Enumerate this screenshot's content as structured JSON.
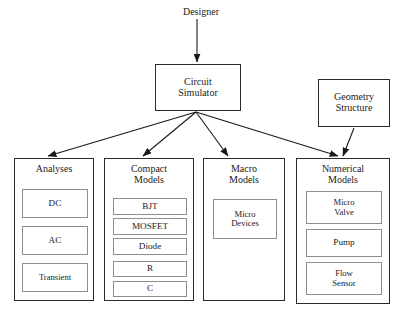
{
  "diagram": {
    "title_label": "Designer",
    "root_actor": {
      "name": "designer",
      "label": "Designer"
    },
    "nodes": [
      {
        "id": "circuit-simulator",
        "label": "Circuit\nSimulator",
        "x": 155,
        "y": 64,
        "w": 86,
        "h": 47
      },
      {
        "id": "geometry-structure",
        "label": "Geometry\nStructure",
        "x": 318,
        "y": 79,
        "w": 72,
        "h": 48
      }
    ],
    "columns": [
      {
        "id": "analyses",
        "title": "Analyses",
        "x": 14,
        "y": 158,
        "w": 80,
        "h": 143,
        "items": [
          {
            "id": "dc",
            "label": "DC",
            "x": 7,
            "y": 30,
            "w": 66,
            "h": 29
          },
          {
            "id": "ac",
            "label": "AC",
            "x": 7,
            "y": 67,
            "w": 66,
            "h": 29
          },
          {
            "id": "transient",
            "label": "Transient",
            "x": 7,
            "y": 104,
            "w": 66,
            "h": 29
          }
        ]
      },
      {
        "id": "compact-models",
        "title": "Compact\nModels",
        "x": 104,
        "y": 158,
        "w": 90,
        "h": 143,
        "items": [
          {
            "id": "bjt",
            "label": "BJT",
            "x": 8,
            "y": 39,
            "w": 74,
            "h": 17
          },
          {
            "id": "mosfet",
            "label": "MOSFET",
            "x": 8,
            "y": 59,
            "w": 74,
            "h": 17
          },
          {
            "id": "diode",
            "label": "Diode",
            "x": 8,
            "y": 79,
            "w": 74,
            "h": 17
          },
          {
            "id": "r",
            "label": "R",
            "x": 8,
            "y": 102,
            "w": 74,
            "h": 16
          },
          {
            "id": "c",
            "label": "C",
            "x": 8,
            "y": 122,
            "w": 74,
            "h": 16
          }
        ]
      },
      {
        "id": "macro-models",
        "title": "Macro\nModels",
        "x": 203,
        "y": 158,
        "w": 82,
        "h": 143,
        "items": [
          {
            "id": "micro-devices",
            "label": "Micro\nDevices",
            "x": 9,
            "y": 40,
            "w": 64,
            "h": 40
          }
        ]
      },
      {
        "id": "numerical-models",
        "title": "Numerical\nModels",
        "x": 296,
        "y": 158,
        "w": 94,
        "h": 146,
        "items": [
          {
            "id": "micro-valve",
            "label": "Micro\nValve",
            "x": 9,
            "y": 32,
            "w": 76,
            "h": 33
          },
          {
            "id": "pump",
            "label": "Pump",
            "x": 9,
            "y": 70,
            "w": 76,
            "h": 28
          },
          {
            "id": "flow-sensor",
            "label": "Flow\nSensor",
            "x": 9,
            "y": 103,
            "w": 76,
            "h": 33
          }
        ]
      }
    ],
    "edges": [
      {
        "id": "designer-to-simulator",
        "from": "designer",
        "to": "circuit-simulator",
        "x1": 197,
        "y1": 19,
        "x2": 197,
        "y2": 62
      },
      {
        "id": "simulator-to-analyses",
        "from": "circuit-simulator",
        "to": "analyses",
        "x1": 196,
        "y1": 112,
        "x2": 48,
        "y2": 156
      },
      {
        "id": "simulator-to-compact",
        "from": "circuit-simulator",
        "to": "compact-models",
        "x1": 196,
        "y1": 112,
        "x2": 143,
        "y2": 156
      },
      {
        "id": "simulator-to-macro",
        "from": "circuit-simulator",
        "to": "macro-models",
        "x1": 196,
        "y1": 112,
        "x2": 228,
        "y2": 156
      },
      {
        "id": "simulator-to-numerical",
        "from": "circuit-simulator",
        "to": "numerical-models",
        "x1": 196,
        "y1": 112,
        "x2": 338,
        "y2": 156
      },
      {
        "id": "geometry-to-numerical",
        "from": "geometry-structure",
        "to": "numerical-models",
        "x1": 354,
        "y1": 128,
        "x2": 343,
        "y2": 156
      }
    ],
    "style": {
      "background": "#ffffff",
      "outer_border": "#2b2b2b",
      "inner_border": "#8f8f8f",
      "text": "#1a1a1a",
      "edge": "#1a1a1a"
    }
  }
}
